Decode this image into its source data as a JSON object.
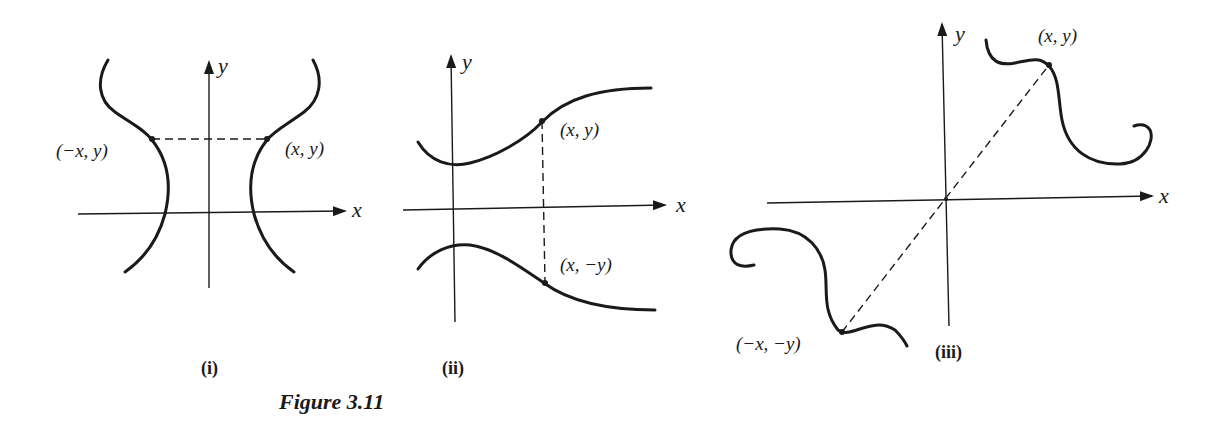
{
  "figure": {
    "caption": "Figure 3.11",
    "panels": [
      {
        "id": "i",
        "label": "(i)",
        "symmetry": "y-axis",
        "axis_x": "x",
        "axis_y": "y",
        "points": [
          {
            "name": "left-point",
            "label": "(−x, y)"
          },
          {
            "name": "right-point",
            "label": "(x, y)"
          }
        ]
      },
      {
        "id": "ii",
        "label": "(ii)",
        "symmetry": "x-axis",
        "axis_x": "x",
        "axis_y": "y",
        "points": [
          {
            "name": "upper-point",
            "label": "(x, y)"
          },
          {
            "name": "lower-point",
            "label": "(x, −y)"
          }
        ]
      },
      {
        "id": "iii",
        "label": "(iii)",
        "symmetry": "origin",
        "axis_x": "x",
        "axis_y": "y",
        "points": [
          {
            "name": "upper-right-point",
            "label": "(x, y)"
          },
          {
            "name": "lower-left-point",
            "label": "(−x, −y)"
          }
        ]
      }
    ]
  },
  "colors": {
    "ink": "#1a1a1a",
    "background": "#ffffff"
  }
}
